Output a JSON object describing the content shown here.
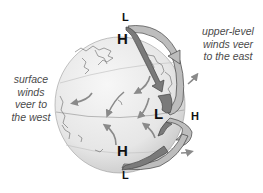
{
  "diagram": {
    "title": "",
    "captions": {
      "upper_level": [
        "upper-level",
        "winds veer",
        "to the east"
      ],
      "surface": [
        "surface",
        "winds",
        "veer to",
        "the west"
      ]
    },
    "pressure_labels": {
      "top_L": "L",
      "top_H": "H",
      "equator_L": "L",
      "equator_H": "H",
      "south_H": "H",
      "bottom_L": "L"
    },
    "colors": {
      "globe_fill": "#ececec",
      "globe_shadow": "#cfcfcf",
      "coastline": "#555555",
      "surface_arrow": "#8a8a8a",
      "upper_arrow_fill": "#b8b8b8",
      "lower_arrow_fill": "#777777",
      "arrow_outline": "#444444",
      "caption_text": "#4a4a4a"
    }
  }
}
